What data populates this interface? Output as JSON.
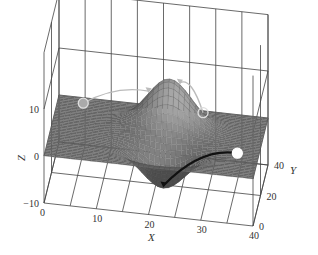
{
  "chart_data": {
    "type": "surface3d",
    "title": "",
    "xlabel": "X",
    "ylabel": "Y",
    "zlabel": "Z",
    "xlim": [
      0,
      40
    ],
    "ylim": [
      0,
      40
    ],
    "zlim": [
      -10,
      10
    ],
    "x_ticks": [
      "0",
      "10",
      "20",
      "30",
      "40"
    ],
    "y_ticks": [
      "0",
      "20",
      "40"
    ],
    "z_ticks": [
      "-10",
      "0",
      "10"
    ],
    "grid": true,
    "surface": {
      "description": "Flat plane at z=0 with a peak (hill) and a pit (valley) forming an S-shaped ridge",
      "features": [
        {
          "kind": "peak",
          "x": 22,
          "y": 28,
          "height": 10
        },
        {
          "kind": "pit",
          "x": 22,
          "y": 12,
          "height": -8
        }
      ]
    },
    "markers": [
      {
        "name": "ball-left",
        "x": 5,
        "y": 35,
        "style": "gray-filled"
      },
      {
        "name": "ball-top-right",
        "x": 28,
        "y": 34,
        "style": "hollow"
      },
      {
        "name": "ball-right",
        "x": 36,
        "y": 14,
        "style": "white-filled"
      }
    ],
    "paths": [
      {
        "name": "path-left",
        "from": [
          5,
          35
        ],
        "to": [
          18,
          28
        ],
        "style": "light"
      },
      {
        "name": "path-top-right",
        "from": [
          28,
          34
        ],
        "to": [
          24,
          28
        ],
        "style": "light"
      },
      {
        "name": "path-right",
        "from": [
          36,
          14
        ],
        "to": [
          22,
          12
        ],
        "style": "dark-arrow"
      }
    ],
    "colors": {
      "surface_low": "#6a6a6a",
      "surface_high": "#e8e8e8",
      "grid": "#444444",
      "arrow": "#111111"
    }
  }
}
